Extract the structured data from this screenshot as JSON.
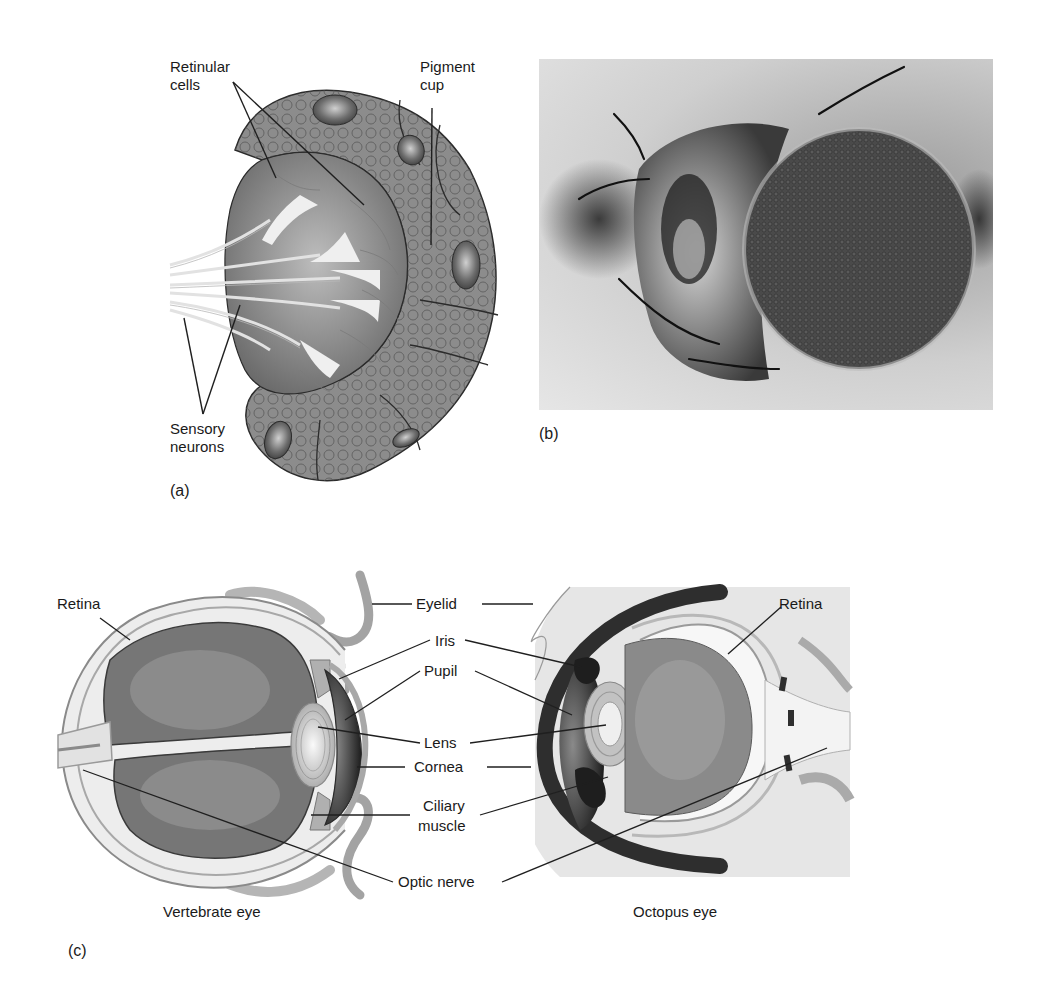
{
  "panels": {
    "a": {
      "letter": "(a)",
      "title": "Flatworm eyespot",
      "labels": {
        "retinular_cells_1": "Retinular",
        "retinular_cells_2": "cells",
        "pigment_cup_1": "Pigment",
        "pigment_cup_2": "cup",
        "sensory_neurons_1": "Sensory",
        "sensory_neurons_2": "neurons"
      }
    },
    "b": {
      "letter": "(b)",
      "image": "compound-eye-insect-photo"
    },
    "c": {
      "letter": "(c)",
      "vertebrate_caption": "Vertebrate eye",
      "octopus_caption": "Octopus eye",
      "labels": {
        "retina_left": "Retina",
        "retina_right": "Retina",
        "eyelid": "Eyelid",
        "iris": "Iris",
        "pupil": "Pupil",
        "lens": "Lens",
        "cornea": "Cornea",
        "ciliary_1": "Ciliary",
        "ciliary_2": "muscle",
        "optic_nerve": "Optic nerve"
      }
    }
  },
  "colors": {
    "cell_gray": "#8a8a8a",
    "dark_gray": "#4a4a4a",
    "light_gray": "#d9d9d9",
    "outline": "#2b2b2b",
    "text": "#1a1a1a"
  }
}
